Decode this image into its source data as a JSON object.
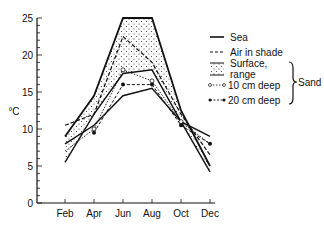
{
  "chart_data": {
    "type": "line",
    "title": "",
    "xlabel": "",
    "ylabel": "°C",
    "ylim": [
      0,
      25
    ],
    "yticks": [
      0,
      5,
      10,
      15,
      20,
      25
    ],
    "categories": [
      "Feb",
      "Apr",
      "Jun",
      "Aug",
      "Oct",
      "Dec"
    ],
    "grid": false,
    "legend_position": "right",
    "series": [
      {
        "name": "Sea",
        "style": "solid",
        "values": [
          8,
          10.5,
          14.5,
          15.5,
          11,
          9
        ]
      },
      {
        "name": "Air in shade",
        "style": "dashed",
        "values": [
          10.5,
          12,
          22.5,
          19,
          12,
          6.5
        ]
      },
      {
        "name": "Surface, range (upper)",
        "style": "solid-band",
        "values": [
          9,
          14.5,
          25,
          25,
          12.5,
          5
        ]
      },
      {
        "name": "Surface, range (lower)",
        "style": "solid-band",
        "values": [
          5.5,
          12,
          17.5,
          18,
          11,
          4.2
        ]
      },
      {
        "name": "10 cm deep",
        "style": "dotted-open-circle",
        "values": [
          7,
          10,
          18,
          16.5,
          11,
          8
        ]
      },
      {
        "name": "20 cm deep",
        "style": "dashed-filled-circle",
        "values": [
          null,
          9.5,
          16,
          16,
          10.5,
          8
        ]
      }
    ],
    "legend": {
      "entries": [
        "Sea",
        "Air in shade",
        "Surface, range",
        "10 cm deep",
        "20 cm deep"
      ],
      "group_label": "Sand"
    }
  }
}
